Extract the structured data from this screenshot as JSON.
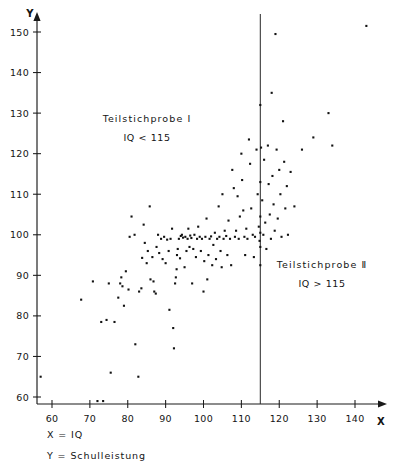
{
  "figure": {
    "background": "#ffffff",
    "ink_color": "#141414"
  },
  "axes": {
    "x_axis_title": "X",
    "y_axis_title": "Y",
    "x_ticks": [
      60,
      70,
      80,
      90,
      100,
      110,
      120,
      130,
      140
    ],
    "y_ticks": [
      60,
      70,
      80,
      90,
      100,
      110,
      120,
      130,
      140,
      150
    ]
  },
  "annotations": {
    "left": {
      "title": "Teilstichprobe  I",
      "subtitle": "IQ < 115"
    },
    "right": {
      "title": "Teilstichprobe  Ⅱ",
      "subtitle": "IQ > 115"
    },
    "divider_value": 115
  },
  "footer": {
    "line1": "X = IQ",
    "line2": "Y = Schulleistung"
  },
  "chart_data": {
    "type": "scatter",
    "title": "",
    "xlabel": "X = IQ",
    "ylabel": "Y = Schulleistung",
    "xlim": [
      55,
      145
    ],
    "ylim": [
      56,
      153
    ],
    "grid": false,
    "legend": "none",
    "marker": "square-dot",
    "marker_size_px": 2.1,
    "vertical_reference_line": {
      "x": 115,
      "label": "IQ = 115 split"
    },
    "groups": [
      {
        "name": "Teilstichprobe I",
        "criterion": "IQ < 115",
        "annotation_position": [
          85,
          129
        ]
      },
      {
        "name": "Teilstichprobe II",
        "criterion": "IQ > 115",
        "annotation_position": [
          122,
          91
        ]
      }
    ],
    "points": [
      [
        57.0,
        65.0
      ],
      [
        67.7,
        84.0
      ],
      [
        70.8,
        88.5
      ],
      [
        72.0,
        59.0
      ],
      [
        73.5,
        59.0
      ],
      [
        73.0,
        78.5
      ],
      [
        74.4,
        79.0
      ],
      [
        75.0,
        88.0
      ],
      [
        75.5,
        66.0
      ],
      [
        76.5,
        78.5
      ],
      [
        77.5,
        84.5
      ],
      [
        78.0,
        88.0
      ],
      [
        78.3,
        89.5
      ],
      [
        78.6,
        87.3
      ],
      [
        79.0,
        82.5
      ],
      [
        79.5,
        91.0
      ],
      [
        80.2,
        86.5
      ],
      [
        80.5,
        99.5
      ],
      [
        81.0,
        104.5
      ],
      [
        81.8,
        100.0
      ],
      [
        82.0,
        73.0
      ],
      [
        82.8,
        65.0
      ],
      [
        83.0,
        86.0
      ],
      [
        83.6,
        86.8
      ],
      [
        83.8,
        94.3
      ],
      [
        84.2,
        102.5
      ],
      [
        84.5,
        98.0
      ],
      [
        85.0,
        93.0
      ],
      [
        85.3,
        96.0
      ],
      [
        85.8,
        107.0
      ],
      [
        86.0,
        89.0
      ],
      [
        86.5,
        94.5
      ],
      [
        86.8,
        88.5
      ],
      [
        87.0,
        86.0
      ],
      [
        87.4,
        85.5
      ],
      [
        87.6,
        97.0
      ],
      [
        88.0,
        100.0
      ],
      [
        88.3,
        95.5
      ],
      [
        88.8,
        99.0
      ],
      [
        89.2,
        94.0
      ],
      [
        89.6,
        99.5
      ],
      [
        90.0,
        93.0
      ],
      [
        90.4,
        98.8
      ],
      [
        90.8,
        96.0
      ],
      [
        91.0,
        81.5
      ],
      [
        91.3,
        99.0
      ],
      [
        91.7,
        101.5
      ],
      [
        92.0,
        77.0
      ],
      [
        92.2,
        72.0
      ],
      [
        92.5,
        88.0
      ],
      [
        92.7,
        89.5
      ],
      [
        92.9,
        91.5
      ],
      [
        93.0,
        95.0
      ],
      [
        93.2,
        96.5
      ],
      [
        93.5,
        99.0
      ],
      [
        93.8,
        94.2
      ],
      [
        94.0,
        99.7
      ],
      [
        94.3,
        100.0
      ],
      [
        94.6,
        99.3
      ],
      [
        95.0,
        92.0
      ],
      [
        95.2,
        99.5
      ],
      [
        95.5,
        96.0
      ],
      [
        95.8,
        99.0
      ],
      [
        96.0,
        101.5
      ],
      [
        96.3,
        97.0
      ],
      [
        96.5,
        99.8
      ],
      [
        96.8,
        99.2
      ],
      [
        97.0,
        88.0
      ],
      [
        97.3,
        96.5
      ],
      [
        97.6,
        100.0
      ],
      [
        98.0,
        94.5
      ],
      [
        98.3,
        99.0
      ],
      [
        98.6,
        102.0
      ],
      [
        99.0,
        99.5
      ],
      [
        99.3,
        96.0
      ],
      [
        99.6,
        99.0
      ],
      [
        100.0,
        86.0
      ],
      [
        100.2,
        93.5
      ],
      [
        100.5,
        99.5
      ],
      [
        100.8,
        104.0
      ],
      [
        101.0,
        89.0
      ],
      [
        101.3,
        95.0
      ],
      [
        101.6,
        99.0
      ],
      [
        102.0,
        99.6
      ],
      [
        102.3,
        92.5
      ],
      [
        102.6,
        97.5
      ],
      [
        103.0,
        100.5
      ],
      [
        103.3,
        94.0
      ],
      [
        103.6,
        99.0
      ],
      [
        104.0,
        107.0
      ],
      [
        104.2,
        99.5
      ],
      [
        104.5,
        96.0
      ],
      [
        104.8,
        92.0
      ],
      [
        105.0,
        110.0
      ],
      [
        105.3,
        99.0
      ],
      [
        105.6,
        101.0
      ],
      [
        106.0,
        99.7
      ],
      [
        106.3,
        95.0
      ],
      [
        106.6,
        103.5
      ],
      [
        107.0,
        99.0
      ],
      [
        107.3,
        92.5
      ],
      [
        107.6,
        116.0
      ],
      [
        108.0,
        111.5
      ],
      [
        108.3,
        99.5
      ],
      [
        108.6,
        101.0
      ],
      [
        109.0,
        109.5
      ],
      [
        109.3,
        99.0
      ],
      [
        109.6,
        104.5
      ],
      [
        110.0,
        120.0
      ],
      [
        110.2,
        113.5
      ],
      [
        110.5,
        106.0
      ],
      [
        110.8,
        99.5
      ],
      [
        111.0,
        95.0
      ],
      [
        111.3,
        101.5
      ],
      [
        111.6,
        99.0
      ],
      [
        112.0,
        123.5
      ],
      [
        112.3,
        117.5
      ],
      [
        112.6,
        106.5
      ],
      [
        113.0,
        100.0
      ],
      [
        113.3,
        94.5
      ],
      [
        113.6,
        99.5
      ],
      [
        114.0,
        121.0
      ],
      [
        114.3,
        110.0
      ],
      [
        114.6,
        102.0
      ],
      [
        114.8,
        98.5
      ],
      [
        115.0,
        132.0
      ],
      [
        115.0,
        113.0
      ],
      [
        115.0,
        104.5
      ],
      [
        115.0,
        100.5
      ],
      [
        115.0,
        97.0
      ],
      [
        115.0,
        92.5
      ],
      [
        115.2,
        121.5
      ],
      [
        115.5,
        108.5
      ],
      [
        115.8,
        100.0
      ],
      [
        116.0,
        118.5
      ],
      [
        116.3,
        103.0
      ],
      [
        116.6,
        96.5
      ],
      [
        117.0,
        122.0
      ],
      [
        117.2,
        112.5
      ],
      [
        117.5,
        105.0
      ],
      [
        117.8,
        99.0
      ],
      [
        118.0,
        135.0
      ],
      [
        118.2,
        114.5
      ],
      [
        118.5,
        107.5
      ],
      [
        118.8,
        101.0
      ],
      [
        119.0,
        149.5
      ],
      [
        119.3,
        121.0
      ],
      [
        119.6,
        104.0
      ],
      [
        120.0,
        116.0
      ],
      [
        120.3,
        110.0
      ],
      [
        120.6,
        99.5
      ],
      [
        121.0,
        128.0
      ],
      [
        121.3,
        118.0
      ],
      [
        121.6,
        106.5
      ],
      [
        122.0,
        112.0
      ],
      [
        122.3,
        100.0
      ],
      [
        123.0,
        115.5
      ],
      [
        124.0,
        107.0
      ],
      [
        126.0,
        121.0
      ],
      [
        129.0,
        124.0
      ],
      [
        133.0,
        130.0
      ],
      [
        134.0,
        122.0
      ],
      [
        143.0,
        151.5
      ]
    ]
  }
}
